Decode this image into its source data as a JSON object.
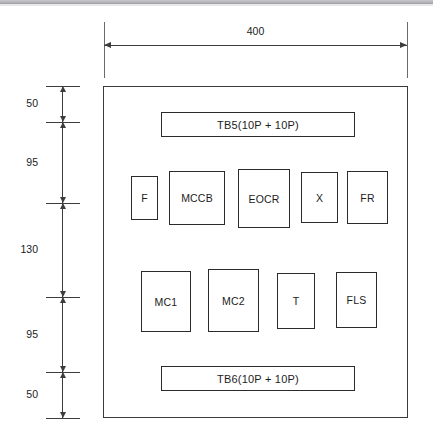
{
  "drawing": {
    "title": "Control panel internal component layout",
    "units": "mm",
    "overall_width_label": "400",
    "enclosure": {
      "name": "enclosure-outline",
      "x": 103,
      "y": 86,
      "w": 305,
      "h": 332
    },
    "horizontal_dimension": {
      "label": "400",
      "x_start": 104,
      "x_end": 407,
      "line_y": 45,
      "ext_top": 22,
      "ext_bottom": 78
    },
    "vertical_dimension_chain": {
      "axis_x": 62,
      "tick_left": 46,
      "tick_right": 80,
      "stations": [
        86,
        122,
        203,
        297,
        372,
        418
      ],
      "segments": [
        {
          "label": "50",
          "y_top": 86,
          "y_bottom": 122
        },
        {
          "label": "95",
          "y_top": 122,
          "y_bottom": 203
        },
        {
          "label": "130",
          "y_top": 203,
          "y_bottom": 297
        },
        {
          "label": "95",
          "y_top": 297,
          "y_bottom": 372
        },
        {
          "label": "50",
          "y_top": 372,
          "y_bottom": 418
        }
      ]
    },
    "terminal_blocks": [
      {
        "name": "tb5",
        "label": "TB5(10P + 10P)",
        "x": 161,
        "y": 112,
        "w": 194,
        "h": 25
      },
      {
        "name": "tb6",
        "label": "TB6(10P + 10P)",
        "x": 161,
        "y": 366,
        "w": 194,
        "h": 25
      }
    ],
    "component_rows": [
      {
        "name": "upper-component-row",
        "components": [
          {
            "name": "fuse",
            "label": "F",
            "x": 131,
            "y": 176,
            "w": 27,
            "h": 44
          },
          {
            "name": "mccb",
            "label": "MCCB",
            "x": 169,
            "y": 171,
            "w": 56,
            "h": 54
          },
          {
            "name": "eocr",
            "label": "EOCR",
            "x": 238,
            "y": 169,
            "w": 52,
            "h": 59
          },
          {
            "name": "relay-x",
            "label": "X",
            "x": 301,
            "y": 172,
            "w": 37,
            "h": 51
          },
          {
            "name": "flicker-relay",
            "label": "FR",
            "x": 347,
            "y": 171,
            "w": 41,
            "h": 53
          }
        ]
      },
      {
        "name": "lower-component-row",
        "components": [
          {
            "name": "magnetic-contactor-1",
            "label": "MC1",
            "x": 141,
            "y": 271,
            "w": 50,
            "h": 61
          },
          {
            "name": "magnetic-contactor-2",
            "label": "MC2",
            "x": 208,
            "y": 269,
            "w": 51,
            "h": 63
          },
          {
            "name": "timer",
            "label": "T",
            "x": 277,
            "y": 273,
            "w": 38,
            "h": 56
          },
          {
            "name": "float-level-switch",
            "label": "FLS",
            "x": 336,
            "y": 272,
            "w": 41,
            "h": 56
          }
        ]
      }
    ],
    "colors": {
      "line": "#2b2b2b",
      "dimension_line": "#3c3c3c",
      "text": "#1c1c1c",
      "background": "#ffffff",
      "scan_band": "#b6b6ba"
    }
  }
}
